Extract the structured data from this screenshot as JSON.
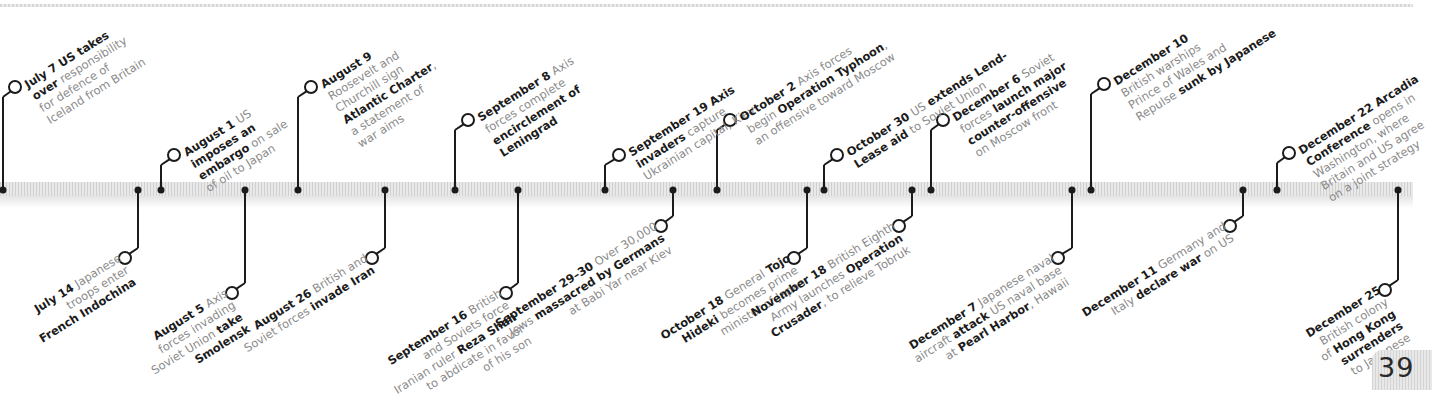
{
  "page_number": "39",
  "colors": {
    "ink": "#1b1b1b",
    "body_text": "#8a8a8a",
    "bar": "#dcdcdc"
  },
  "events_above": [
    {
      "date": "July 7",
      "x": 3,
      "cx": 15,
      "cy": 87,
      "lines": [
        [
          {
            "t": "July 7 ",
            "b": true
          },
          {
            "t": "US takes",
            "b": true
          }
        ],
        [
          {
            "t": "over",
            "b": true
          },
          {
            "t": " responsibility",
            "b": false
          }
        ],
        [
          {
            "t": "for defence of",
            "b": false
          }
        ],
        [
          {
            "t": "Iceland from Britain",
            "b": false
          }
        ]
      ]
    },
    {
      "date": "August 1",
      "x": 161,
      "cx": 174,
      "cy": 155,
      "lines": [
        [
          {
            "t": "August 1",
            "b": true
          },
          {
            "t": " US",
            "b": false
          }
        ],
        [
          {
            "t": "imposes an",
            "b": true
          }
        ],
        [
          {
            "t": "embargo",
            "b": true
          },
          {
            "t": " on sale",
            "b": false
          }
        ],
        [
          {
            "t": "of oil to Japan",
            "b": false
          }
        ]
      ]
    },
    {
      "date": "August 9",
      "x": 298,
      "cx": 311,
      "cy": 87,
      "lines": [
        [
          {
            "t": "August 9",
            "b": true
          }
        ],
        [
          {
            "t": "Roosevelt and",
            "b": false
          }
        ],
        [
          {
            "t": "Churchill sign",
            "b": false
          }
        ],
        [
          {
            "t": "Atlantic Charter",
            "b": true
          },
          {
            "t": ",",
            "b": false
          }
        ],
        [
          {
            "t": "a statement of",
            "b": false
          }
        ],
        [
          {
            "t": "war aims",
            "b": false
          }
        ]
      ]
    },
    {
      "date": "September 8",
      "x": 455,
      "cx": 468,
      "cy": 120,
      "lines": [
        [
          {
            "t": "September 8",
            "b": true
          },
          {
            "t": " Axis",
            "b": false
          }
        ],
        [
          {
            "t": "forces complete",
            "b": false
          }
        ],
        [
          {
            "t": "encirclement of",
            "b": true
          }
        ],
        [
          {
            "t": "Leningrad",
            "b": true
          }
        ]
      ]
    },
    {
      "date": "September 19",
      "x": 605,
      "cx": 619,
      "cy": 155,
      "lines": [
        [
          {
            "t": "September 19 Axis",
            "b": true
          }
        ],
        [
          {
            "t": "invaders",
            "b": true
          },
          {
            "t": " capture",
            "b": false
          }
        ],
        [
          {
            "t": "Ukrainian capital, Kiev",
            "b": false
          }
        ]
      ]
    },
    {
      "date": "October 2",
      "x": 717,
      "cx": 730,
      "cy": 120,
      "lines": [
        [
          {
            "t": "October 2",
            "b": true
          },
          {
            "t": " Axis forces",
            "b": false
          }
        ],
        [
          {
            "t": "begin ",
            "b": false
          },
          {
            "t": "Operation Typhoon",
            "b": true
          },
          {
            "t": ",",
            "b": false
          }
        ],
        [
          {
            "t": "an offensive toward Moscow",
            "b": false
          }
        ]
      ]
    },
    {
      "date": "October 30",
      "x": 824,
      "cx": 837,
      "cy": 155,
      "lines": [
        [
          {
            "t": "October 30",
            "b": true
          },
          {
            "t": " US ",
            "b": false
          },
          {
            "t": "extends Lend-",
            "b": true
          }
        ],
        [
          {
            "t": "Lease aid",
            "b": true
          },
          {
            "t": " to Soviet Union",
            "b": false
          }
        ]
      ]
    },
    {
      "date": "December 6",
      "x": 931,
      "cx": 943,
      "cy": 120,
      "lines": [
        [
          {
            "t": "December 6",
            "b": true
          },
          {
            "t": " Soviet",
            "b": false
          }
        ],
        [
          {
            "t": "forces ",
            "b": false
          },
          {
            "t": "launch major",
            "b": true
          }
        ],
        [
          {
            "t": "counter-offensive",
            "b": true
          }
        ],
        [
          {
            "t": "on Moscow front",
            "b": false
          }
        ]
      ]
    },
    {
      "date": "December 10",
      "x": 1091,
      "cx": 1104,
      "cy": 84,
      "lines": [
        [
          {
            "t": "December 10",
            "b": true
          }
        ],
        [
          {
            "t": "British warships",
            "b": false
          }
        ],
        [
          {
            "t": "Prince of Wales",
            "b": false
          },
          {
            "t": " and",
            "b": false
          }
        ],
        [
          {
            "t": "Repulse",
            "b": false
          },
          {
            "t": " sunk by Japanese",
            "b": true
          }
        ]
      ]
    },
    {
      "date": "December 22",
      "x": 1277,
      "cx": 1289,
      "cy": 153,
      "lines": [
        [
          {
            "t": "December 22 Arcadia",
            "b": true
          }
        ],
        [
          {
            "t": "Conference",
            "b": true
          },
          {
            "t": " opens in",
            "b": false
          }
        ],
        [
          {
            "t": "Washington, where",
            "b": false
          }
        ],
        [
          {
            "t": "Britain and US agree",
            "b": false
          }
        ],
        [
          {
            "t": "on a joint strategy",
            "b": false
          }
        ]
      ]
    }
  ],
  "events_below": [
    {
      "date": "July 14",
      "x": 138,
      "cx": 125,
      "cy": 258,
      "lines": [
        [
          {
            "t": "July 14",
            "b": true
          },
          {
            "t": " Japanese",
            "b": false
          }
        ],
        [
          {
            "t": "troops enter",
            "b": false
          }
        ],
        [
          {
            "t": "French Indochina",
            "b": true
          }
        ]
      ]
    },
    {
      "date": "August 5",
      "x": 245,
      "cx": 232,
      "cy": 293,
      "lines": [
        [
          {
            "t": "August 5",
            "b": true
          },
          {
            "t": " Axis",
            "b": false
          }
        ],
        [
          {
            "t": "forces invading",
            "b": false
          }
        ],
        [
          {
            "t": "Soviet Union ",
            "b": false
          },
          {
            "t": "take",
            "b": true
          }
        ],
        [
          {
            "t": "Smolensk",
            "b": true
          }
        ]
      ]
    },
    {
      "date": "August 26",
      "x": 385,
      "cx": 372,
      "cy": 258,
      "lines": [
        [
          {
            "t": "August 26",
            "b": true
          },
          {
            "t": " British and",
            "b": false
          }
        ],
        [
          {
            "t": "Soviet forces ",
            "b": false
          },
          {
            "t": "invade Iran",
            "b": true
          }
        ]
      ]
    },
    {
      "date": "September 16",
      "x": 518,
      "cx": 506,
      "cy": 293,
      "lines": [
        [
          {
            "t": "September 16",
            "b": true
          },
          {
            "t": " British",
            "b": false
          }
        ],
        [
          {
            "t": "and Soviets force",
            "b": false
          }
        ],
        [
          {
            "t": "Iranian ruler ",
            "b": false
          },
          {
            "t": "Reza Shah",
            "b": true
          }
        ],
        [
          {
            "t": "to abdicate in favor",
            "b": false
          }
        ],
        [
          {
            "t": "of his son",
            "b": false
          }
        ]
      ]
    },
    {
      "date": "September 29-30",
      "x": 673,
      "cx": 661,
      "cy": 226,
      "lines": [
        [
          {
            "t": "September 29–30",
            "b": true
          },
          {
            "t": " Over 30,000",
            "b": false
          }
        ],
        [
          {
            "t": "Jews ",
            "b": false
          },
          {
            "t": "massacred by Germans",
            "b": true
          }
        ],
        [
          {
            "t": "at Babi Yar near Kiev",
            "b": false
          }
        ]
      ]
    },
    {
      "date": "October 18",
      "x": 807,
      "cx": 794,
      "cy": 258,
      "lines": [
        [
          {
            "t": "October 18",
            "b": true
          },
          {
            "t": " General ",
            "b": false
          },
          {
            "t": "Tojo",
            "b": true
          }
        ],
        [
          {
            "t": "Hideki",
            "b": true
          },
          {
            "t": " becomes prime",
            "b": false
          }
        ],
        [
          {
            "t": "minister of Japan",
            "b": false
          }
        ]
      ]
    },
    {
      "date": "November 18",
      "x": 912,
      "cx": 899,
      "cy": 226,
      "lines": [
        [
          {
            "t": "November 18",
            "b": true
          },
          {
            "t": " British Eighth",
            "b": false
          }
        ],
        [
          {
            "t": "Army launches ",
            "b": false
          },
          {
            "t": "Operation",
            "b": true
          }
        ],
        [
          {
            "t": "Crusader",
            "b": true
          },
          {
            "t": ", to relieve Tobruk",
            "b": false
          }
        ]
      ]
    },
    {
      "date": "December 7",
      "x": 1072,
      "cx": 1058,
      "cy": 258,
      "lines": [
        [
          {
            "t": "December 7",
            "b": true
          },
          {
            "t": " Japanese naval",
            "b": false
          }
        ],
        [
          {
            "t": "aircraft ",
            "b": false
          },
          {
            "t": "attack",
            "b": true
          },
          {
            "t": " US naval base",
            "b": false
          }
        ],
        [
          {
            "t": "at ",
            "b": false
          },
          {
            "t": "Pearl Harbor",
            "b": true
          },
          {
            "t": ", Hawaii",
            "b": false
          }
        ]
      ]
    },
    {
      "date": "December 11",
      "x": 1243,
      "cx": 1230,
      "cy": 226,
      "lines": [
        [
          {
            "t": "December 11",
            "b": true
          },
          {
            "t": " Germany and",
            "b": false
          }
        ],
        [
          {
            "t": "Italy ",
            "b": false
          },
          {
            "t": "declare war",
            "b": true
          },
          {
            "t": " on US",
            "b": false
          }
        ]
      ]
    },
    {
      "date": "December 25",
      "x": 1398,
      "cx": 1385,
      "cy": 290,
      "lines": [
        [
          {
            "t": "December 25",
            "b": true
          }
        ],
        [
          {
            "t": "British colony",
            "b": false
          }
        ],
        [
          {
            "t": "of ",
            "b": false
          },
          {
            "t": "Hong Kong",
            "b": true
          }
        ],
        [
          {
            "t": "surrenders",
            "b": true
          }
        ],
        [
          {
            "t": "to Japanese",
            "b": false
          }
        ]
      ]
    }
  ]
}
